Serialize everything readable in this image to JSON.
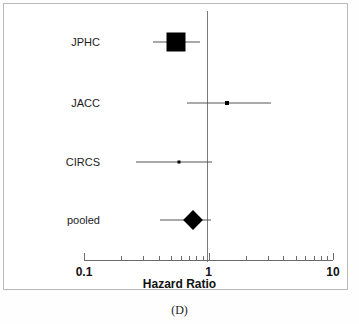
{
  "figure": {
    "panel_caption": "(D)",
    "axis_title": "Hazard Ratio",
    "axis_tick_labels": [
      "0.1",
      "1",
      "10"
    ],
    "null_line_value": "1",
    "marker_color": "#000000",
    "line_color": "#555555",
    "axis_color": "#6b6b6b"
  },
  "chart_data": {
    "type": "forest",
    "title": "",
    "subtitle": "",
    "xlabel": "Hazard Ratio",
    "ylabel": "",
    "xscale": "log",
    "xlim": [
      0.1,
      10
    ],
    "xticks": [
      0.1,
      1,
      10
    ],
    "xticklabels": [
      "0.1",
      "1",
      "10"
    ],
    "minor_ticks": [
      0.2,
      0.3,
      0.4,
      0.5,
      0.6,
      0.7,
      0.8,
      0.9,
      2,
      3,
      4,
      5,
      6,
      7,
      8,
      9
    ],
    "reference_line": 1,
    "grid": false,
    "legend": "none",
    "categories": [
      "JPHC",
      "JACC",
      "CIRCS",
      "pooled"
    ],
    "rows": [
      {
        "label": "JPHC",
        "estimate": 0.55,
        "ci_low": 0.36,
        "ci_high": 0.86,
        "marker": "square",
        "marker_size": 19,
        "weight": "large"
      },
      {
        "label": "JACC",
        "estimate": 1.4,
        "ci_low": 0.67,
        "ci_high": 3.2,
        "marker": "square",
        "marker_size": 4,
        "weight": "small"
      },
      {
        "label": "CIRCS",
        "estimate": 0.58,
        "ci_low": 0.26,
        "ci_high": 1.07,
        "marker": "square",
        "marker_size": 3,
        "weight": "small"
      },
      {
        "label": "pooled",
        "estimate": 0.75,
        "ci_low": 0.41,
        "ci_high": 1.05,
        "marker": "diamond",
        "marker_size": 20,
        "weight": "pooled"
      }
    ]
  }
}
